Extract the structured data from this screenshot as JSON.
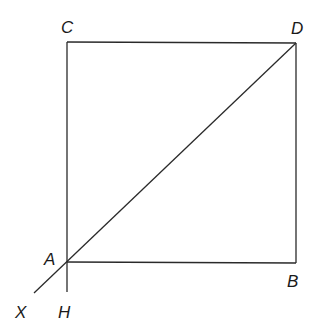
{
  "diagram": {
    "type": "geometry",
    "shape": "square ABDC with diagonal AD extended to X and side CA extended to H",
    "points": {
      "A": {
        "label": "A",
        "x": 67,
        "y": 262
      },
      "B": {
        "label": "B",
        "x": 296,
        "y": 263
      },
      "C": {
        "label": "C",
        "x": 67,
        "y": 42
      },
      "D": {
        "label": "D",
        "x": 296,
        "y": 43
      },
      "X": {
        "label": "X",
        "x": 34,
        "y": 293
      },
      "H": {
        "label": "H",
        "x": 67,
        "y": 292
      }
    },
    "segments": [
      {
        "from": "C",
        "to": "D"
      },
      {
        "from": "D",
        "to": "B"
      },
      {
        "from": "B",
        "to": "A"
      },
      {
        "from": "C",
        "to": "H"
      },
      {
        "from": "D",
        "to": "X"
      }
    ],
    "colors": {
      "line": "#2a2a2a",
      "text": "#1a1a1a",
      "background": "#ffffff"
    }
  }
}
